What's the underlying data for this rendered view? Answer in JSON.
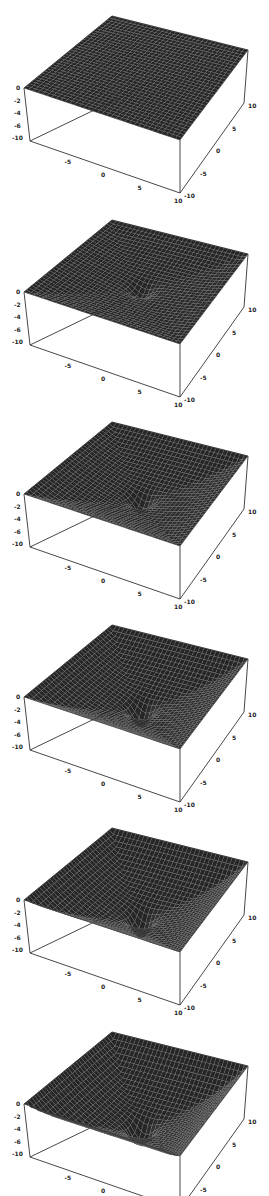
{
  "figure": {
    "panel_count": 6,
    "background": "#ffffff",
    "surface_color": "#2b2b2b",
    "mesh_color": "#8a8a8a",
    "axis_color": "#333333"
  },
  "chart_data": [
    {
      "type": "surface3d",
      "panel": 1,
      "title": "",
      "x_ticks": [
        "-5",
        "0",
        "5",
        "10"
      ],
      "y_ticks": [
        "-10",
        "-5",
        "0",
        "5",
        "10"
      ],
      "z_ticks": [
        "0",
        "-2",
        "-4",
        "-6",
        "-10"
      ],
      "xlim": [
        -10,
        10
      ],
      "ylim": [
        -10,
        10
      ],
      "zlim": [
        -10,
        0
      ],
      "bowl_depth": 0.0,
      "center_dip": 0.0,
      "grid": true
    },
    {
      "type": "surface3d",
      "panel": 2,
      "title": "",
      "x_ticks": [
        "-5",
        "0",
        "5",
        "10"
      ],
      "y_ticks": [
        "-10",
        "-5",
        "0",
        "5",
        "10"
      ],
      "z_ticks": [
        "0",
        "-2",
        "-4",
        "-6",
        "-10"
      ],
      "xlim": [
        -10,
        10
      ],
      "ylim": [
        -10,
        10
      ],
      "zlim": [
        -10,
        0
      ],
      "bowl_depth": 0.25,
      "center_dip": 0.5,
      "grid": true
    },
    {
      "type": "surface3d",
      "panel": 3,
      "title": "",
      "x_ticks": [
        "-5",
        "0",
        "5",
        "10"
      ],
      "y_ticks": [
        "-10",
        "-5",
        "0",
        "5",
        "10"
      ],
      "z_ticks": [
        "0",
        "-2",
        "-4",
        "-6",
        "-10"
      ],
      "xlim": [
        -10,
        10
      ],
      "ylim": [
        -10,
        10
      ],
      "zlim": [
        -10,
        0
      ],
      "bowl_depth": 0.45,
      "center_dip": 0.7,
      "grid": true
    },
    {
      "type": "surface3d",
      "panel": 4,
      "title": "",
      "x_ticks": [
        "-5",
        "0",
        "5",
        "10"
      ],
      "y_ticks": [
        "-10",
        "-5",
        "0",
        "5",
        "10"
      ],
      "z_ticks": [
        "0",
        "-2",
        "-4",
        "-6",
        "-10"
      ],
      "xlim": [
        -10,
        10
      ],
      "ylim": [
        -10,
        10
      ],
      "zlim": [
        -10,
        0
      ],
      "bowl_depth": 0.6,
      "center_dip": 0.9,
      "grid": true
    },
    {
      "type": "surface3d",
      "panel": 5,
      "title": "",
      "x_ticks": [
        "-5",
        "0",
        "5",
        "10"
      ],
      "y_ticks": [
        "-10",
        "-5",
        "0",
        "5",
        "10"
      ],
      "z_ticks": [
        "0",
        "-2",
        "-4",
        "-6",
        "-10"
      ],
      "xlim": [
        -10,
        10
      ],
      "ylim": [
        -10,
        10
      ],
      "zlim": [
        -10,
        0
      ],
      "bowl_depth": 0.75,
      "center_dip": 1.0,
      "grid": true
    },
    {
      "type": "surface3d",
      "panel": 6,
      "title": "",
      "x_ticks": [
        "-5",
        "0",
        "5",
        "10"
      ],
      "y_ticks": [
        "-10",
        "-5",
        "0",
        "5",
        "10"
      ],
      "z_ticks": [
        "0",
        "-2",
        "-4",
        "-6",
        "-10"
      ],
      "xlim": [
        -10,
        10
      ],
      "ylim": [
        -10,
        10
      ],
      "zlim": [
        -10,
        0
      ],
      "bowl_depth": 0.9,
      "center_dip": 1.1,
      "grid": true
    }
  ],
  "panels": [
    {
      "top": 0
    },
    {
      "top": 204
    },
    {
      "top": 406
    },
    {
      "top": 609
    },
    {
      "top": 812
    },
    {
      "top": 1016
    }
  ]
}
